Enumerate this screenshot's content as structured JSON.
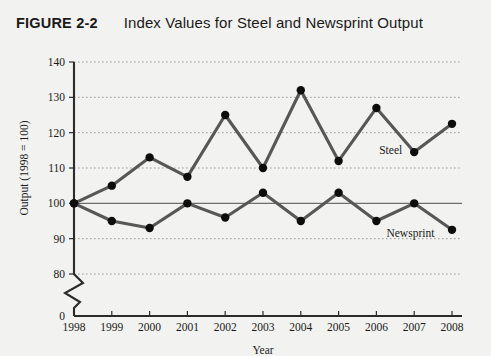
{
  "figure": {
    "number": "FIGURE 2-2",
    "title": "Index Values for Steel and Newsprint Output"
  },
  "chart_data": {
    "type": "line",
    "title": "Index Values for Steel and Newsprint Output",
    "xlabel": "Year",
    "ylabel": "Output (1998 = 100)",
    "categories": [
      "1998",
      "1999",
      "2000",
      "2001",
      "2002",
      "2003",
      "2004",
      "2005",
      "2006",
      "2007",
      "2008"
    ],
    "x": [
      1998,
      1999,
      2000,
      2001,
      2002,
      2003,
      2004,
      2005,
      2006,
      2007,
      2008
    ],
    "series": [
      {
        "name": "Steel",
        "values": [
          100,
          105,
          113,
          107.5,
          125,
          110,
          132,
          112,
          127,
          114.5,
          122.5
        ],
        "color": "#575757",
        "marker_color": "#0d0d0d",
        "label_position": "inline-right-2007"
      },
      {
        "name": "Newsprint",
        "values": [
          100,
          95,
          93,
          100,
          96,
          103,
          95,
          103,
          95,
          100,
          92.5
        ],
        "color": "#575757",
        "marker_color": "#0d0d0d",
        "label_position": "inline-below-2006"
      }
    ],
    "ylim": [
      80,
      140
    ],
    "yticks": [
      80,
      90,
      100,
      110,
      120,
      130,
      140
    ],
    "ytick_labels": [
      "80",
      "90",
      "100",
      "110",
      "120",
      "130",
      "140"
    ],
    "y_axis_break": true,
    "y_axis_break_label": "0",
    "xlim": [
      1998,
      2008
    ],
    "grid": true,
    "grid_axis": "y",
    "grid_style": "dotted",
    "baseline_value": 100,
    "legend": "inline-labels",
    "legend_position": "inline"
  },
  "labels": {
    "y_axis_title": "Output (1998 = 100)",
    "x_axis_title": "Year",
    "zero_tick": "0",
    "series_steel": "Steel",
    "series_newsprint": "Newsprint"
  },
  "colors": {
    "background": "#f2f2f0",
    "axis": "#2b2b2b",
    "grid": "#9a9a9a",
    "baseline": "#6e6e6e",
    "line": "#575757",
    "marker": "#0d0d0d",
    "text": "#1a1a1a"
  }
}
